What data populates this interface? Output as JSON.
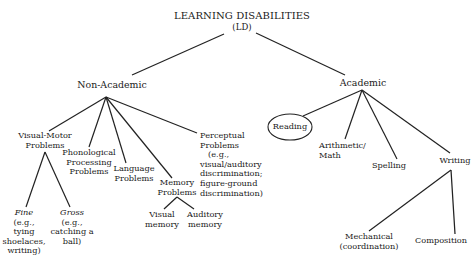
{
  "diagram": {
    "type": "tree",
    "root": {
      "title": "LEARNING DISABILITIES",
      "abbr": "(LD)"
    },
    "non_academic": {
      "label": "Non-Academic",
      "visual_motor": {
        "line1": "Visual-Motor",
        "line2": "Problems",
        "fine": {
          "label": "Fine",
          "l1": "(e.g.,",
          "l2": "tying",
          "l3": "shoelaces,",
          "l4": "writing)"
        },
        "gross": {
          "label": "Gross",
          "l1": "(e.g.,",
          "l2": "catching a",
          "l3": "ball)"
        }
      },
      "phonological": {
        "line1": "Phonological",
        "line2": "Processing",
        "line3": "Problems"
      },
      "language": {
        "line1": "Language",
        "line2": "Problems"
      },
      "memory": {
        "line1": "Memory",
        "line2": "Problems",
        "visual": {
          "line1": "Visual",
          "line2": "memory"
        },
        "auditory": {
          "line1": "Auditory",
          "line2": "memory"
        }
      },
      "perceptual": {
        "line1": "Perceptual",
        "line2": "Problems",
        "line3": "(e.g.,",
        "line4": "visual/auditory",
        "line5": "discrimination;",
        "line6": "figure-ground",
        "line7": "discrimination)"
      }
    },
    "academic": {
      "label": "Academic",
      "reading": "Reading",
      "arithmetic": {
        "line1": "Arithmetic/",
        "line2": "Math"
      },
      "spelling": "Spelling",
      "writing": {
        "label": "Writing",
        "mechanical": {
          "line1": "Mechanical",
          "line2": "(coordination)"
        },
        "composition": "Composition"
      }
    }
  }
}
